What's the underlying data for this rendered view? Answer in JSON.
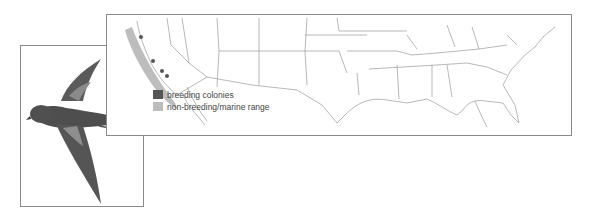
{
  "figure": {
    "type": "species range map",
    "region": "Contiguous United States and northwestern Mexico",
    "illustration": "storm-petrel in flight, dark plumage with pale wing bar, forked tail"
  },
  "legend": {
    "items": [
      {
        "label": "breeding colonies",
        "color": "#555555"
      },
      {
        "label": "non-breeding/marine range",
        "color": "#bdbdbd"
      }
    ]
  },
  "map": {
    "range_area": "Pacific coast from northern California to Baja California",
    "breeding_colony_count": 4,
    "border_color": "#8a8a8a",
    "state_line_color": "#9a9a9a"
  }
}
